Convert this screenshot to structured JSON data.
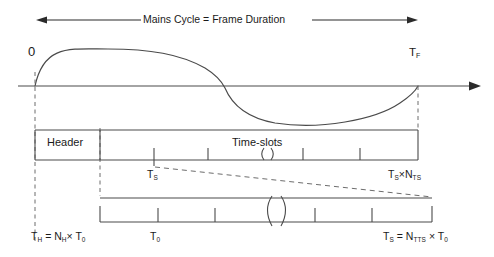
{
  "diagram": {
    "title": "Mains Cycle = Frame Duration",
    "type": "timing-diagram",
    "width": 494,
    "height": 257,
    "background_color": "#ffffff",
    "stroke_color": "#3a3a3a",
    "text_color": "#1a1a1a"
  },
  "top_arrow": {
    "label": "Mains Cycle = Frame Duration",
    "left_x": 36,
    "right_x": 418,
    "y": 20,
    "double_headed": true
  },
  "waveform": {
    "origin_label": "0",
    "end_label_main": "T",
    "end_label_sub": "F",
    "axis_y": 86,
    "axis_start_x": 18,
    "axis_end_x": 480,
    "zero_crossings": [
      35,
      225,
      418
    ],
    "peak_amplitude": 37,
    "description": "one full mains sine cycle from 0 to T_F"
  },
  "frame_bar": {
    "left_x": 35,
    "right_x": 418,
    "top_y": 130,
    "bottom_y": 160,
    "segments": [
      {
        "name": "header",
        "label": "Header",
        "start_x": 35,
        "end_x": 100
      },
      {
        "name": "time-slots",
        "label": "Time-slots",
        "start_x": 100,
        "end_x": 418
      }
    ],
    "tick_positions": [
      154,
      208,
      303,
      360
    ],
    "break_symbol_x": 267,
    "start_label_main": "T",
    "start_label_sub": "S",
    "end_label": "Tₛ×Nₜₛ",
    "end_label_parts": {
      "t": "T",
      "t_sub": "S",
      "times": "×",
      "n": "N",
      "n_sub": "TS"
    }
  },
  "slot_bar": {
    "left_x": 100,
    "right_x": 432,
    "top_y": 198,
    "bottom_y": 222,
    "tick_positions": [
      158,
      215,
      315,
      372
    ],
    "break_symbol_x": 278
  },
  "labels": {
    "header_duration": {
      "t": "T",
      "t_sub": "H",
      "equals": " = ",
      "n": "N",
      "n_sub": "H",
      "times": "× ",
      "t0": "T",
      "t0_sub": "0",
      "full": "Tₕ = Nₕ× T₀"
    },
    "base_period": {
      "t": "T",
      "t_sub": "0",
      "full": "T₀"
    },
    "slot_duration": {
      "t": "T",
      "t_sub": "S",
      "equals": " = ",
      "n": "N",
      "n_sub": "TTS",
      "times": " × ",
      "t0": "T",
      "t0_sub": "0",
      "full": "Tₛ = Nₜₜₛ × T₀"
    }
  },
  "connectors": {
    "dashed_vertical_lines_x": [
      35,
      100,
      418
    ],
    "dashed_expansion": [
      {
        "from_x": 154,
        "from_y": 166,
        "to_x": 100,
        "to_y": 196
      },
      {
        "from_x": 418,
        "from_y": 166,
        "to_x": 432,
        "to_y": 196
      }
    ]
  }
}
